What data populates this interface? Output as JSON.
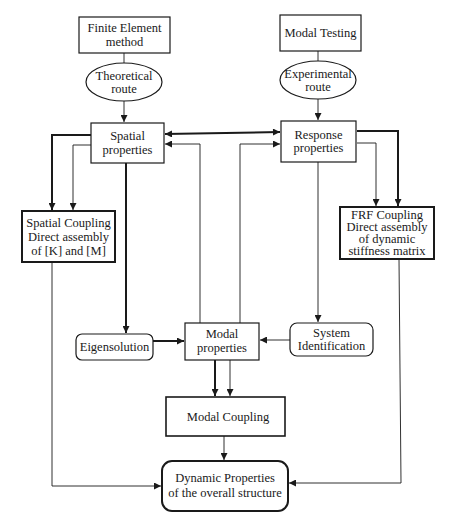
{
  "diagram": {
    "nodes": {
      "fem": {
        "lines": [
          "Finite Element",
          "method"
        ]
      },
      "theoretical": {
        "lines": [
          "Theoretical",
          "route"
        ]
      },
      "spatial": {
        "lines": [
          "Spatial",
          "properties"
        ]
      },
      "modal_testing": {
        "lines": [
          "Modal Testing"
        ]
      },
      "experimental": {
        "lines": [
          "Experimental",
          "route"
        ]
      },
      "response": {
        "lines": [
          "Response",
          "properties"
        ]
      },
      "spatial_coupling": {
        "lines": [
          "Spatial Coupling",
          "Direct assembly",
          "of [K] and [M]"
        ]
      },
      "frf_coupling": {
        "lines": [
          "FRF Coupling",
          "Direct assembly",
          "of dynamic",
          "stiffness matrix"
        ]
      },
      "eigensolution": {
        "lines": [
          "Eigensolution"
        ]
      },
      "modal": {
        "lines": [
          "Modal",
          "properties"
        ]
      },
      "system_id": {
        "lines": [
          "System",
          "Identification"
        ]
      },
      "modal_coupling": {
        "lines": [
          "Modal Coupling"
        ]
      },
      "dynamic": {
        "lines": [
          "Dynamic Properties",
          "of the overall structure"
        ]
      }
    },
    "edges": [
      {
        "from": "fem",
        "to": "theoretical"
      },
      {
        "from": "theoretical",
        "to": "spatial"
      },
      {
        "from": "modal_testing",
        "to": "experimental"
      },
      {
        "from": "experimental",
        "to": "response"
      },
      {
        "from": "spatial",
        "to": "response",
        "bidirectional": true
      },
      {
        "from": "modal",
        "to": "spatial"
      },
      {
        "from": "modal",
        "to": "response"
      },
      {
        "from": "spatial",
        "to": "spatial_coupling"
      },
      {
        "from": "response",
        "to": "frf_coupling"
      },
      {
        "from": "spatial",
        "to": "eigensolution"
      },
      {
        "from": "response",
        "to": "system_id"
      },
      {
        "from": "eigensolution",
        "to": "modal"
      },
      {
        "from": "system_id",
        "to": "modal"
      },
      {
        "from": "modal",
        "to": "modal_coupling"
      },
      {
        "from": "modal_coupling",
        "to": "dynamic"
      },
      {
        "from": "spatial_coupling",
        "to": "dynamic"
      },
      {
        "from": "frf_coupling",
        "to": "dynamic"
      }
    ]
  }
}
